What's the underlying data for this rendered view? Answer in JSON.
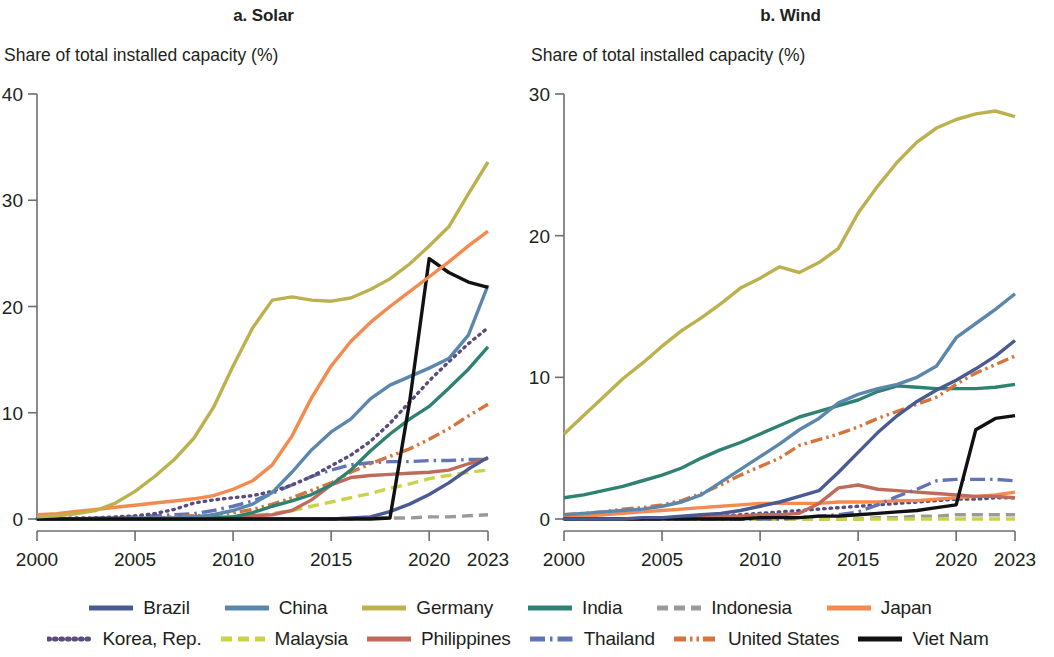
{
  "figure": {
    "panels": [
      {
        "id": "solar",
        "title": "a. Solar",
        "ylabel": "Share of total installed capacity (%)"
      },
      {
        "id": "wind",
        "title": "b. Wind",
        "ylabel": "Share of total installed capacity (%)"
      }
    ]
  },
  "legend": {
    "row1": [
      {
        "label": "Brazil",
        "color": "#4a5b92",
        "style": "solid"
      },
      {
        "label": "China",
        "color": "#5c87ad",
        "style": "solid"
      },
      {
        "label": "Germany",
        "color": "#bcb14f",
        "style": "solid"
      },
      {
        "label": "India",
        "color": "#2f8272",
        "style": "solid"
      },
      {
        "label": "Indonesia",
        "color": "#9a9a9a",
        "style": "dashed"
      },
      {
        "label": "Japan",
        "color": "#f58a4e",
        "style": "solid"
      }
    ],
    "row2": [
      {
        "label": "Korea, Rep.",
        "color": "#5b4c7d",
        "style": "dotted"
      },
      {
        "label": "Malaysia",
        "color": "#cbd24a",
        "style": "dashed"
      },
      {
        "label": "Philippines",
        "color": "#c06a5c",
        "style": "solid"
      },
      {
        "label": "Thailand",
        "color": "#6274b5",
        "style": "dashdot"
      },
      {
        "label": "United States",
        "color": "#d4743e",
        "style": "dashdotdot"
      },
      {
        "label": "Viet Nam",
        "color": "#111111",
        "style": "solid"
      }
    ]
  },
  "chart_data": [
    {
      "type": "line",
      "id": "solar",
      "title": "a. Solar",
      "xlabel": "",
      "ylabel": "Share of total installed capacity (%)",
      "xlim": [
        2000,
        2023
      ],
      "ylim": [
        0,
        40
      ],
      "xticks": [
        2000,
        2005,
        2010,
        2015,
        2020,
        2023
      ],
      "yticks": [
        0,
        10,
        20,
        30,
        40
      ],
      "grid": false,
      "legend_position": "bottom",
      "x": [
        2000,
        2001,
        2002,
        2003,
        2004,
        2005,
        2006,
        2007,
        2008,
        2009,
        2010,
        2011,
        2012,
        2013,
        2014,
        2015,
        2016,
        2017,
        2018,
        2019,
        2020,
        2021,
        2022,
        2023
      ],
      "series": [
        {
          "name": "Germany",
          "color": "#bcb14f",
          "style": "solid",
          "values": [
            0.2,
            0.3,
            0.5,
            0.8,
            1.5,
            2.6,
            4.0,
            5.6,
            7.6,
            10.5,
            14.4,
            18.0,
            20.6,
            20.9,
            20.6,
            20.5,
            20.8,
            21.6,
            22.6,
            24.0,
            25.7,
            27.5,
            30.6,
            33.6
          ]
        },
        {
          "name": "Japan",
          "color": "#f58a4e",
          "style": "solid",
          "values": [
            0.4,
            0.5,
            0.7,
            0.9,
            1.1,
            1.3,
            1.5,
            1.7,
            1.9,
            2.2,
            2.8,
            3.6,
            5.1,
            7.8,
            11.4,
            14.4,
            16.7,
            18.5,
            20.0,
            21.4,
            22.8,
            24.2,
            25.7,
            27.1
          ]
        },
        {
          "name": "Viet Nam",
          "color": "#111111",
          "style": "solid",
          "values": [
            0.0,
            0.0,
            0.0,
            0.0,
            0.0,
            0.0,
            0.0,
            0.0,
            0.0,
            0.0,
            0.0,
            0.0,
            0.0,
            0.0,
            0.0,
            0.0,
            0.0,
            0.0,
            0.1,
            11.0,
            24.5,
            23.2,
            22.3,
            21.8
          ]
        },
        {
          "name": "China",
          "color": "#5c87ad",
          "style": "solid",
          "values": [
            0.0,
            0.0,
            0.0,
            0.0,
            0.0,
            0.1,
            0.1,
            0.1,
            0.2,
            0.4,
            0.8,
            1.4,
            2.5,
            4.4,
            6.5,
            8.2,
            9.4,
            11.3,
            12.6,
            13.4,
            14.2,
            15.1,
            17.3,
            22.0
          ]
        },
        {
          "name": "Korea, Rep.",
          "color": "#5b4c7d",
          "style": "dotted",
          "values": [
            0.0,
            0.0,
            0.1,
            0.1,
            0.2,
            0.3,
            0.5,
            0.9,
            1.5,
            1.8,
            2.0,
            2.2,
            2.6,
            3.2,
            4.0,
            5.0,
            6.0,
            7.3,
            9.0,
            11.0,
            13.0,
            14.8,
            16.5,
            18.0
          ]
        },
        {
          "name": "India",
          "color": "#2f8272",
          "style": "solid",
          "values": [
            0.0,
            0.0,
            0.0,
            0.0,
            0.0,
            0.0,
            0.0,
            0.0,
            0.0,
            0.1,
            0.2,
            0.6,
            1.2,
            1.7,
            2.3,
            3.2,
            4.6,
            6.4,
            8.0,
            9.4,
            10.6,
            12.3,
            14.1,
            16.2
          ]
        },
        {
          "name": "United States",
          "color": "#d4743e",
          "style": "dashdotdot",
          "values": [
            0.0,
            0.0,
            0.0,
            0.0,
            0.1,
            0.1,
            0.1,
            0.2,
            0.3,
            0.4,
            0.6,
            0.9,
            1.4,
            2.0,
            2.7,
            3.4,
            4.4,
            5.2,
            5.9,
            6.6,
            7.5,
            8.5,
            9.7,
            10.8
          ]
        },
        {
          "name": "Brazil",
          "color": "#4a5b92",
          "style": "solid",
          "values": [
            0.0,
            0.0,
            0.0,
            0.0,
            0.0,
            0.0,
            0.0,
            0.0,
            0.0,
            0.0,
            0.0,
            0.0,
            0.0,
            0.0,
            0.0,
            0.0,
            0.1,
            0.2,
            0.7,
            1.4,
            2.3,
            3.4,
            4.7,
            5.8
          ]
        },
        {
          "name": "Philippines",
          "color": "#c06a5c",
          "style": "solid",
          "values": [
            0.0,
            0.0,
            0.0,
            0.0,
            0.0,
            0.0,
            0.0,
            0.1,
            0.1,
            0.1,
            0.2,
            0.3,
            0.4,
            0.8,
            1.8,
            3.2,
            3.9,
            4.1,
            4.2,
            4.3,
            4.4,
            4.6,
            5.2,
            5.7
          ]
        },
        {
          "name": "Thailand",
          "color": "#6274b5",
          "style": "dashdot",
          "values": [
            0.0,
            0.0,
            0.0,
            0.1,
            0.1,
            0.2,
            0.3,
            0.4,
            0.5,
            0.8,
            1.2,
            1.7,
            2.4,
            3.2,
            4.0,
            4.6,
            5.1,
            5.3,
            5.4,
            5.4,
            5.5,
            5.5,
            5.6,
            5.6
          ]
        },
        {
          "name": "Malaysia",
          "color": "#cbd24a",
          "style": "dashed",
          "values": [
            0.0,
            0.0,
            0.0,
            0.0,
            0.0,
            0.0,
            0.0,
            0.0,
            0.1,
            0.1,
            0.2,
            0.3,
            0.5,
            0.8,
            1.2,
            1.6,
            2.0,
            2.4,
            2.9,
            3.3,
            3.8,
            4.1,
            4.4,
            4.6
          ]
        },
        {
          "name": "Indonesia",
          "color": "#9a9a9a",
          "style": "dashed",
          "values": [
            0.0,
            0.0,
            0.0,
            0.0,
            0.0,
            0.0,
            0.0,
            0.0,
            0.0,
            0.0,
            0.0,
            0.0,
            0.0,
            0.0,
            0.0,
            0.0,
            0.0,
            0.1,
            0.1,
            0.1,
            0.2,
            0.2,
            0.3,
            0.4
          ]
        }
      ]
    },
    {
      "type": "line",
      "id": "wind",
      "title": "b. Wind",
      "xlabel": "",
      "ylabel": "Share of total installed capacity (%)",
      "xlim": [
        2000,
        2023
      ],
      "ylim": [
        0,
        30
      ],
      "xticks": [
        2000,
        2005,
        2010,
        2015,
        2020,
        2023
      ],
      "yticks": [
        0,
        10,
        20,
        30
      ],
      "grid": false,
      "legend_position": "bottom",
      "x": [
        2000,
        2001,
        2002,
        2003,
        2004,
        2005,
        2006,
        2007,
        2008,
        2009,
        2010,
        2011,
        2012,
        2013,
        2014,
        2015,
        2016,
        2017,
        2018,
        2019,
        2020,
        2021,
        2022,
        2023
      ],
      "series": [
        {
          "name": "Germany",
          "color": "#bcb14f",
          "style": "solid",
          "values": [
            6.0,
            7.3,
            8.6,
            9.9,
            11.0,
            12.2,
            13.3,
            14.2,
            15.2,
            16.3,
            17.0,
            17.8,
            17.4,
            18.1,
            19.1,
            21.6,
            23.5,
            25.2,
            26.6,
            27.6,
            28.2,
            28.6,
            28.8,
            28.4
          ]
        },
        {
          "name": "China",
          "color": "#5c87ad",
          "style": "solid",
          "values": [
            0.3,
            0.4,
            0.5,
            0.6,
            0.7,
            0.9,
            1.2,
            1.7,
            2.6,
            3.5,
            4.4,
            5.3,
            6.3,
            7.1,
            8.2,
            8.8,
            9.2,
            9.5,
            10.0,
            10.8,
            12.8,
            13.8,
            14.8,
            15.9
          ]
        },
        {
          "name": "Brazil",
          "color": "#4a5b92",
          "style": "solid",
          "values": [
            0.0,
            0.0,
            0.0,
            0.0,
            0.1,
            0.1,
            0.2,
            0.3,
            0.4,
            0.6,
            0.9,
            1.2,
            1.6,
            2.0,
            3.3,
            4.7,
            6.1,
            7.3,
            8.3,
            9.1,
            9.8,
            10.6,
            11.5,
            12.6
          ]
        },
        {
          "name": "United States",
          "color": "#d4743e",
          "style": "dashdotdot",
          "values": [
            0.3,
            0.4,
            0.5,
            0.7,
            0.8,
            1.0,
            1.3,
            1.8,
            2.4,
            3.1,
            3.7,
            4.3,
            5.2,
            5.6,
            6.0,
            6.5,
            7.1,
            7.6,
            8.1,
            8.6,
            9.5,
            10.3,
            10.9,
            11.5
          ]
        },
        {
          "name": "India",
          "color": "#2f8272",
          "style": "solid",
          "values": [
            1.5,
            1.7,
            2.0,
            2.3,
            2.7,
            3.1,
            3.6,
            4.3,
            4.9,
            5.4,
            6.0,
            6.6,
            7.2,
            7.6,
            8.0,
            8.4,
            9.0,
            9.4,
            9.3,
            9.2,
            9.2,
            9.2,
            9.3,
            9.5
          ]
        },
        {
          "name": "Viet Nam",
          "color": "#111111",
          "style": "solid",
          "values": [
            0.0,
            0.0,
            0.0,
            0.0,
            0.0,
            0.0,
            0.0,
            0.0,
            0.0,
            0.0,
            0.1,
            0.1,
            0.1,
            0.2,
            0.2,
            0.3,
            0.4,
            0.5,
            0.6,
            0.8,
            1.0,
            6.3,
            7.1,
            7.3
          ]
        },
        {
          "name": "Thailand",
          "color": "#6274b5",
          "style": "dashdot",
          "values": [
            0.0,
            0.0,
            0.0,
            0.0,
            0.0,
            0.0,
            0.0,
            0.0,
            0.0,
            0.0,
            0.0,
            0.0,
            0.1,
            0.2,
            0.3,
            0.5,
            1.0,
            1.6,
            2.1,
            2.7,
            2.8,
            2.8,
            2.8,
            2.7
          ]
        },
        {
          "name": "Philippines",
          "color": "#c06a5c",
          "style": "solid",
          "values": [
            0.0,
            0.0,
            0.0,
            0.0,
            0.0,
            0.1,
            0.1,
            0.1,
            0.2,
            0.2,
            0.3,
            0.3,
            0.4,
            1.1,
            2.2,
            2.4,
            2.1,
            2.0,
            1.9,
            1.8,
            1.7,
            1.6,
            1.6,
            1.5
          ]
        },
        {
          "name": "Japan",
          "color": "#f58a4e",
          "style": "solid",
          "values": [
            0.1,
            0.2,
            0.3,
            0.4,
            0.5,
            0.6,
            0.7,
            0.8,
            0.9,
            1.0,
            1.1,
            1.1,
            1.1,
            1.1,
            1.2,
            1.2,
            1.2,
            1.3,
            1.3,
            1.4,
            1.5,
            1.6,
            1.7,
            1.9
          ]
        },
        {
          "name": "Korea, Rep.",
          "color": "#5b4c7d",
          "style": "dotted",
          "values": [
            0.0,
            0.0,
            0.0,
            0.0,
            0.0,
            0.1,
            0.1,
            0.1,
            0.2,
            0.3,
            0.4,
            0.5,
            0.6,
            0.7,
            0.8,
            0.9,
            1.0,
            1.1,
            1.2,
            1.3,
            1.4,
            1.4,
            1.5,
            1.5
          ]
        },
        {
          "name": "Malaysia",
          "color": "#cbd24a",
          "style": "dashed",
          "values": [
            0.0,
            0.0,
            0.0,
            0.0,
            0.0,
            0.0,
            0.0,
            0.0,
            0.0,
            0.0,
            0.0,
            0.0,
            0.0,
            0.0,
            0.0,
            0.0,
            0.0,
            0.0,
            0.0,
            0.0,
            0.0,
            0.0,
            0.0,
            0.0
          ]
        },
        {
          "name": "Indonesia",
          "color": "#9a9a9a",
          "style": "dashed",
          "values": [
            0.0,
            0.0,
            0.0,
            0.0,
            0.0,
            0.0,
            0.0,
            0.0,
            0.0,
            0.0,
            0.0,
            0.0,
            0.0,
            0.0,
            0.0,
            0.0,
            0.1,
            0.1,
            0.2,
            0.2,
            0.3,
            0.3,
            0.3,
            0.3
          ]
        }
      ]
    }
  ]
}
